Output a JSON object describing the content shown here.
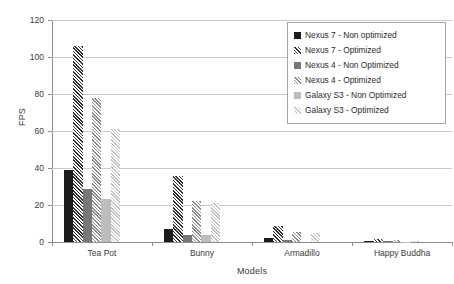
{
  "chart_data": {
    "type": "bar",
    "title": "",
    "xlabel": "Models",
    "ylabel": "FPS",
    "categories": [
      "Tea Pot",
      "Bunny",
      "Armadillo",
      "Happy Buddha"
    ],
    "ylim": [
      0,
      120
    ],
    "yticks": [
      0,
      20,
      40,
      60,
      80,
      100,
      120
    ],
    "grid": true,
    "legend_position": "top-right",
    "series": [
      {
        "name": "Nexus 7 - Non optimized",
        "color": "#1c1c1c",
        "pattern": "solid",
        "values": [
          39,
          7,
          2,
          0.5
        ]
      },
      {
        "name": "Nexus 7 - Optimized",
        "color": "#2f2f2f",
        "pattern": "hatch",
        "values": [
          106,
          35.5,
          8.5,
          1.5
        ]
      },
      {
        "name": "Nexus 4 - Non Optimized",
        "color": "#777777",
        "pattern": "solid",
        "values": [
          28.5,
          4,
          1,
          0.3
        ]
      },
      {
        "name": "Nexus 4 - Optimized",
        "color": "#8a8a8a",
        "pattern": "hatch",
        "values": [
          78,
          22,
          5.5,
          1
        ]
      },
      {
        "name": "Galaxy S3 - Non Optimized",
        "color": "#bdbdbd",
        "pattern": "solid",
        "values": [
          23,
          4,
          0,
          0.2
        ]
      },
      {
        "name": "Galaxy S3 - Optimized",
        "color": "#c2c2c2",
        "pattern": "hatch",
        "values": [
          61,
          21,
          5,
          0.8
        ]
      }
    ]
  },
  "axis": {
    "y_title": "FPS",
    "x_title": "Models",
    "y_tick_labels": [
      "0",
      "20",
      "40",
      "60",
      "80",
      "100",
      "120"
    ],
    "x_tick_labels": [
      "Tea Pot",
      "Bunny",
      "Armadillo",
      "Happy Buddha"
    ]
  },
  "legend": {
    "items": [
      {
        "label": "Nexus 7 - Non optimized"
      },
      {
        "label": "Nexus 7 - Optimized"
      },
      {
        "label": "Nexus 4 - Non Optimized"
      },
      {
        "label": "Nexus 4 - Optimized"
      },
      {
        "label": "Galaxy S3 - Non Optimized"
      },
      {
        "label": "Galaxy S3 - Optimized"
      }
    ]
  }
}
